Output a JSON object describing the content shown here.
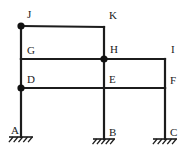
{
  "figure": {
    "width": 192,
    "height": 154,
    "background_color": "#ffffff",
    "line_color": "#1c1c1c",
    "label_color": "#1a1a1a"
  },
  "labels": {
    "A": "A",
    "B": "B",
    "C": "C",
    "D": "D",
    "E": "E",
    "F": "F",
    "G": "G",
    "H": "H",
    "I": "I",
    "J": "J",
    "K": "K"
  },
  "chart_data": {
    "type": "diagram",
    "nodes": [
      {
        "id": "A",
        "label": "A",
        "x": 21,
        "y": 137,
        "marker": "none",
        "label_dx": -10,
        "label_dy": -3,
        "kind": "support-base"
      },
      {
        "id": "B",
        "label": "B",
        "x": 104,
        "y": 139,
        "marker": "none",
        "label_dx": 5,
        "label_dy": -3,
        "kind": "support-base"
      },
      {
        "id": "C",
        "label": "C",
        "x": 165,
        "y": 139,
        "marker": "none",
        "label_dx": 5,
        "label_dy": -3,
        "kind": "support-base"
      },
      {
        "id": "D",
        "label": "D",
        "x": 21,
        "y": 88,
        "marker": "hinge",
        "label_dx": 6,
        "label_dy": -5,
        "kind": "joint"
      },
      {
        "id": "E",
        "label": "E",
        "x": 104,
        "y": 88,
        "marker": "none",
        "label_dx": 5,
        "label_dy": -5,
        "kind": "joint"
      },
      {
        "id": "F",
        "label": "F",
        "x": 165,
        "y": 88,
        "marker": "none",
        "label_dx": 5,
        "label_dy": -4,
        "kind": "joint"
      },
      {
        "id": "G",
        "label": "G",
        "x": 21,
        "y": 59,
        "marker": "none",
        "label_dx": 6,
        "label_dy": -5,
        "kind": "joint"
      },
      {
        "id": "H",
        "label": "H",
        "x": 104,
        "y": 59,
        "marker": "hinge",
        "label_dx": 6,
        "label_dy": -6,
        "kind": "joint"
      },
      {
        "id": "I",
        "label": "I",
        "x": 165,
        "y": 59,
        "marker": "none",
        "label_dx": 6,
        "label_dy": -6,
        "kind": "joint"
      },
      {
        "id": "J",
        "label": "J",
        "x": 21,
        "y": 26,
        "marker": "hinge",
        "label_dx": 6,
        "label_dy": -8,
        "kind": "joint"
      },
      {
        "id": "K",
        "label": "K",
        "x": 104,
        "y": 27,
        "marker": "none",
        "label_dx": 5,
        "label_dy": -8,
        "kind": "joint"
      }
    ],
    "members": [
      {
        "id": "col-AD",
        "from": "A",
        "to": "D",
        "orientation": "vertical"
      },
      {
        "id": "col-DG",
        "from": "D",
        "to": "G",
        "orientation": "vertical"
      },
      {
        "id": "col-GJ",
        "from": "G",
        "to": "J",
        "orientation": "vertical"
      },
      {
        "id": "col-BE",
        "from": "B",
        "to": "E",
        "orientation": "vertical"
      },
      {
        "id": "col-EH",
        "from": "E",
        "to": "H",
        "orientation": "vertical"
      },
      {
        "id": "col-HK",
        "from": "H",
        "to": "K",
        "orientation": "vertical"
      },
      {
        "id": "col-CF",
        "from": "C",
        "to": "F",
        "orientation": "vertical"
      },
      {
        "id": "col-FI",
        "from": "F",
        "to": "I",
        "orientation": "vertical"
      },
      {
        "id": "beam-JK",
        "from": "J",
        "to": "K",
        "orientation": "horizontal"
      },
      {
        "id": "beam-GH",
        "from": "G",
        "to": "H",
        "orientation": "horizontal"
      },
      {
        "id": "beam-HI",
        "from": "H",
        "to": "I",
        "orientation": "horizontal"
      },
      {
        "id": "beam-DE",
        "from": "D",
        "to": "E",
        "orientation": "horizontal"
      },
      {
        "id": "beam-EF",
        "from": "E",
        "to": "F",
        "orientation": "horizontal"
      }
    ],
    "supports": [
      {
        "id": "support-A",
        "node": "A",
        "type": "fixed",
        "x": 21,
        "y": 137,
        "half_width": 12,
        "hatch_count": 5
      },
      {
        "id": "support-B",
        "node": "B",
        "type": "fixed",
        "x": 104,
        "y": 139,
        "half_width": 11,
        "hatch_count": 5
      },
      {
        "id": "support-C",
        "node": "C",
        "type": "fixed",
        "x": 165,
        "y": 139,
        "half_width": 12,
        "hatch_count": 5
      }
    ],
    "hinge_nodes": [
      "J",
      "H",
      "D"
    ],
    "hinge_radius": 3.6
  }
}
